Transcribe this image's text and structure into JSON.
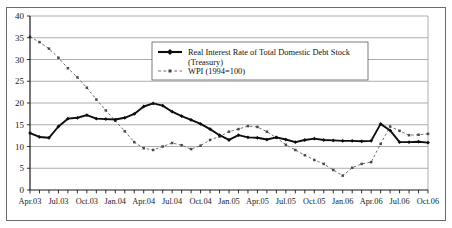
{
  "chart_data": {
    "type": "line",
    "title": "",
    "xlabel": "",
    "ylabel": "",
    "ylim": [
      0,
      40
    ],
    "ytick_step": 5,
    "yticks": [
      "0",
      "5",
      "10",
      "15",
      "20",
      "25",
      "30",
      "35",
      "40"
    ],
    "grid": true,
    "legend_position": "top-center",
    "x": [
      "Apr.03",
      "May.03",
      "Jun.03",
      "Jul.03",
      "Aug.03",
      "Sep.03",
      "Oct.03",
      "Nov.03",
      "Dec.03",
      "Jan.04",
      "Feb.04",
      "Mar.04",
      "Apr.04",
      "May.04",
      "Jun.04",
      "Jul.04",
      "Aug.04",
      "Sep.04",
      "Oct.04",
      "Nov.04",
      "Dec.04",
      "Jan.05",
      "Feb.05",
      "Mar.05",
      "Apr.05",
      "May.05",
      "Jun.05",
      "Jul.05",
      "Aug.05",
      "Sep.05",
      "Oct.05",
      "Nov.05",
      "Dec.05",
      "Jan.06",
      "Feb.06",
      "Mar.06",
      "Apr.06",
      "May.06",
      "Jun.06",
      "Jul.06",
      "Aug.06",
      "Sep.06",
      "Oct.06"
    ],
    "xtick_labels": [
      "Apr.03",
      "Jul.03",
      "Oct.03",
      "Jan.04",
      "Apr.04",
      "Jul.04",
      "Oct.04",
      "Jan.05",
      "Apr.05",
      "Jul.05",
      "Oct.05",
      "Jan.06",
      "Apr.06",
      "Jul.06",
      "Oct.06"
    ],
    "series": [
      {
        "name": "Real Interest Rate of Total Domestic Debt Stock (Treasury)",
        "style": "solid-diamond",
        "color": "#0d0d0d",
        "values": [
          13.1,
          12.2,
          12.0,
          14.6,
          16.4,
          16.6,
          17.2,
          16.4,
          16.3,
          16.2,
          16.6,
          17.5,
          19.2,
          19.9,
          19.4,
          18.0,
          17.0,
          16.1,
          15.2,
          14.0,
          12.6,
          11.5,
          12.6,
          12.1,
          12.0,
          11.6,
          12.1,
          11.6,
          11.0,
          11.5,
          11.8,
          11.5,
          11.4,
          11.3,
          11.3,
          11.2,
          11.3,
          15.2,
          13.7,
          11.0,
          11.0,
          11.1,
          10.9
        ]
      },
      {
        "name": "WPI (1994=100)",
        "style": "dashed-square",
        "color": "#4a4a4a",
        "values": [
          35.2,
          34.0,
          32.5,
          30.4,
          28.0,
          25.9,
          23.5,
          20.8,
          18.3,
          15.9,
          13.5,
          11.0,
          9.6,
          9.2,
          10.0,
          10.8,
          10.3,
          9.4,
          10.2,
          11.5,
          12.3,
          13.4,
          14.0,
          14.7,
          14.5,
          13.4,
          12.0,
          10.4,
          9.2,
          8.0,
          6.9,
          6.0,
          4.6,
          3.3,
          5.1,
          6.0,
          6.4,
          10.6,
          14.6,
          13.6,
          12.6,
          12.7,
          12.9
        ]
      }
    ],
    "legend": [
      {
        "label_line1": "Real Interest Rate of Total Domestic Debt Stock",
        "label_line2": "(Treasury)",
        "marker": "solid-line-diamond"
      },
      {
        "label_line1": "WPI (1994=100)",
        "label_line2": "",
        "marker": "dashed-line-square"
      }
    ]
  }
}
